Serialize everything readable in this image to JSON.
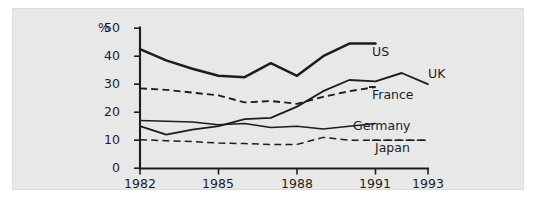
{
  "chart_data": {
    "type": "line",
    "title": "",
    "subtitle": "",
    "xlabel": "",
    "ylabel": "%",
    "unit_label": "%",
    "xlim": [
      1982,
      1993
    ],
    "ylim": [
      0,
      50
    ],
    "yticks": [
      0,
      10,
      20,
      30,
      40,
      50
    ],
    "xticks": [
      1982,
      1985,
      1988,
      1991,
      1993
    ],
    "xtick_labels": [
      "1982",
      "1985",
      "1988",
      "1991",
      "1993"
    ],
    "ytick_labels": [
      "0",
      "10",
      "20",
      "30",
      "40",
      "50"
    ],
    "grid": false,
    "legend_position": "right-inline-labels",
    "x": [
      1982,
      1983,
      1984,
      1985,
      1986,
      1987,
      1988,
      1989,
      1990,
      1991,
      1992,
      1993
    ],
    "series": [
      {
        "name": "US",
        "label": "US",
        "style": "solid",
        "width": "thick",
        "color": "#1d1d1d",
        "x": [
          1982,
          1983,
          1984,
          1985,
          1986,
          1987,
          1988,
          1989,
          1990,
          1991
        ],
        "values": [
          42.5,
          38.5,
          35.5,
          33.0,
          32.5,
          37.5,
          33.0,
          40.0,
          44.5,
          44.5
        ]
      },
      {
        "name": "UK",
        "label": "UK",
        "style": "solid",
        "width": "med",
        "color": "#1d1d1d",
        "x": [
          1982,
          1983,
          1984,
          1985,
          1986,
          1987,
          1988,
          1989,
          1990,
          1991,
          1992,
          1993
        ],
        "values": [
          15.0,
          12.0,
          13.8,
          15.0,
          17.5,
          18.0,
          22.0,
          27.5,
          31.5,
          31.0,
          34.0,
          30.0
        ]
      },
      {
        "name": "France",
        "label": "France",
        "style": "dashed",
        "width": "med",
        "color": "#1d1d1d",
        "x": [
          1982,
          1983,
          1984,
          1985,
          1986,
          1987,
          1988,
          1989,
          1990,
          1991
        ],
        "values": [
          28.5,
          28.0,
          27.0,
          26.0,
          23.5,
          24.0,
          23.0,
          25.5,
          27.5,
          29.0
        ]
      },
      {
        "name": "Germany",
        "label": "Germany",
        "style": "solid",
        "width": "thin",
        "color": "#1d1d1d",
        "x": [
          1982,
          1983,
          1984,
          1985,
          1986,
          1987,
          1988,
          1989,
          1990,
          1991
        ],
        "values": [
          17.0,
          16.8,
          16.5,
          15.5,
          16.0,
          14.5,
          15.0,
          14.0,
          15.0,
          16.0
        ]
      },
      {
        "name": "Japan",
        "label": "Japan",
        "style": "dashed",
        "width": "thin",
        "color": "#1d1d1d",
        "x": [
          1982,
          1983,
          1984,
          1985,
          1986,
          1987,
          1988,
          1989,
          1990,
          1991,
          1992,
          1993
        ],
        "values": [
          10.2,
          9.8,
          9.5,
          9.0,
          8.8,
          8.5,
          8.5,
          11.0,
          10.0,
          10.0,
          10.0,
          10.0
        ]
      }
    ],
    "series_labels": [
      {
        "text": "US",
        "x": 372,
        "y": 46
      },
      {
        "text": "UK",
        "x": 428,
        "y": 68
      },
      {
        "text": "France",
        "x": 372,
        "y": 89
      },
      {
        "text": "Germany",
        "x": 353,
        "y": 120
      },
      {
        "text": "Japan",
        "x": 375,
        "y": 142
      }
    ]
  }
}
